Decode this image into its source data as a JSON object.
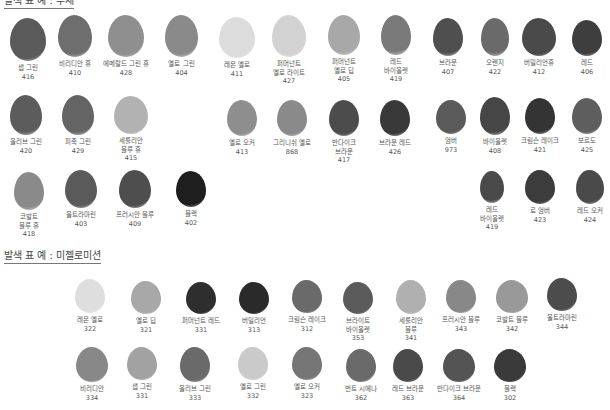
{
  "sections": [
    {
      "title": "발색 표 예 : 수채",
      "swatches": [
        {
          "name": "샙 그린",
          "code": "416",
          "x": 10,
          "y": 18,
          "w": 36,
          "h": 43,
          "color": "#5a5a5a"
        },
        {
          "name": "비리디안 휴",
          "code": "410",
          "x": 58,
          "y": 15,
          "w": 34,
          "h": 42,
          "color": "#6e6e6e"
        },
        {
          "name": "에메랄드 그린 휴",
          "code": "428",
          "x": 108,
          "y": 15,
          "w": 36,
          "h": 42,
          "color": "#8f8f8f"
        },
        {
          "name": "옐로 그린",
          "code": "404",
          "x": 165,
          "y": 15,
          "w": 33,
          "h": 42,
          "color": "#8a8a8a"
        },
        {
          "name": "레몬 옐로",
          "code": "411",
          "x": 219,
          "y": 17,
          "w": 36,
          "h": 41,
          "color": "#dcdcdc"
        },
        {
          "name": "퍼머넌트\n옐로 라이트",
          "code": "427",
          "x": 272,
          "y": 15,
          "w": 34,
          "h": 42,
          "color": "#d2d2d2"
        },
        {
          "name": "퍼머넌트\n옐로 딥",
          "code": "405",
          "x": 328,
          "y": 15,
          "w": 32,
          "h": 40,
          "color": "#a8a8a8"
        },
        {
          "name": "레드\n바이올렛",
          "code": "419",
          "x": 381,
          "y": 15,
          "w": 30,
          "h": 40,
          "color": "#7a7a7a"
        },
        {
          "name": "브라운",
          "code": "407",
          "x": 433,
          "y": 18,
          "w": 30,
          "h": 38,
          "color": "#4f4f4f"
        },
        {
          "name": "오렌지",
          "code": "422",
          "x": 481,
          "y": 18,
          "w": 28,
          "h": 38,
          "color": "#6a6a6a"
        },
        {
          "name": "버밀리언휴",
          "code": "412",
          "x": 522,
          "y": 18,
          "w": 34,
          "h": 38,
          "color": "#4a4a4a"
        },
        {
          "name": "레드",
          "code": "406",
          "x": 572,
          "y": 20,
          "w": 30,
          "h": 36,
          "color": "#3e3e3e"
        },
        {
          "name": "올리브 그린",
          "code": "420",
          "x": 10,
          "y": 95,
          "w": 32,
          "h": 40,
          "color": "#5c5c5c"
        },
        {
          "name": "피죽 그린",
          "code": "429",
          "x": 62,
          "y": 95,
          "w": 32,
          "h": 40,
          "color": "#646464"
        },
        {
          "name": "세룰리안\n블루 휴",
          "code": "415",
          "x": 114,
          "y": 96,
          "w": 34,
          "h": 38,
          "color": "#b2b2b2"
        },
        {
          "name": "옐로 오커",
          "code": "413",
          "x": 227,
          "y": 100,
          "w": 30,
          "h": 36,
          "color": "#8e8e8e"
        },
        {
          "name": "그리니쉬 옐로",
          "code": "868",
          "x": 277,
          "y": 100,
          "w": 30,
          "h": 36,
          "color": "#8a8a8a"
        },
        {
          "name": "반다이크\n브라운",
          "code": "417",
          "x": 329,
          "y": 100,
          "w": 30,
          "h": 36,
          "color": "#4c4c4c"
        },
        {
          "name": "브라운 레드",
          "code": "426",
          "x": 380,
          "y": 100,
          "w": 30,
          "h": 36,
          "color": "#393939"
        },
        {
          "name": "엄버",
          "code": "973",
          "x": 436,
          "y": 100,
          "w": 30,
          "h": 34,
          "color": "#5a5a5a"
        },
        {
          "name": "바이올렛",
          "code": "408",
          "x": 480,
          "y": 97,
          "w": 30,
          "h": 38,
          "color": "#464646"
        },
        {
          "name": "크림슨 레이크",
          "code": "421",
          "x": 525,
          "y": 98,
          "w": 30,
          "h": 36,
          "color": "#343434"
        },
        {
          "name": "보르도",
          "code": "425",
          "x": 572,
          "y": 98,
          "w": 30,
          "h": 36,
          "color": "#5e5e5e"
        },
        {
          "name": "코발트\n블루 휴",
          "code": "418",
          "x": 14,
          "y": 172,
          "w": 30,
          "h": 38,
          "color": "#8a8a8a"
        },
        {
          "name": "울트라마린",
          "code": "403",
          "x": 65,
          "y": 170,
          "w": 32,
          "h": 38,
          "color": "#5a5a5a"
        },
        {
          "name": "프러시안 블루",
          "code": "409",
          "x": 119,
          "y": 170,
          "w": 32,
          "h": 38,
          "color": "#4e4e4e"
        },
        {
          "name": "블랙",
          "code": "402",
          "x": 176,
          "y": 171,
          "w": 30,
          "h": 36,
          "color": "#1e1e1e"
        },
        {
          "name": "레드\n바이올렛",
          "code": "419",
          "x": 480,
          "y": 171,
          "w": 24,
          "h": 32,
          "color": "#4a4a4a"
        },
        {
          "name": "로 엄버",
          "code": "423",
          "x": 525,
          "y": 170,
          "w": 30,
          "h": 34,
          "color": "#3c3c3c"
        },
        {
          "name": "레드 오커",
          "code": "424",
          "x": 576,
          "y": 170,
          "w": 28,
          "h": 34,
          "color": "#4a4a4a"
        }
      ]
    },
    {
      "title": "발색 표 예 : 미젤로미션",
      "swatches": [
        {
          "name": "레몬 옐로",
          "code": "322",
          "x": 75,
          "y": 279,
          "w": 30,
          "h": 34,
          "color": "#dedede"
        },
        {
          "name": "옐로 딥",
          "code": "321",
          "x": 131,
          "y": 281,
          "w": 30,
          "h": 33,
          "color": "#a8a8a8"
        },
        {
          "name": "퍼머넌트 레드",
          "code": "331",
          "x": 186,
          "y": 282,
          "w": 30,
          "h": 32,
          "color": "#2e2e2e"
        },
        {
          "name": "버밀리언",
          "code": "313",
          "x": 239,
          "y": 282,
          "w": 30,
          "h": 32,
          "color": "#2a2a2a"
        },
        {
          "name": "크림슨 레이크",
          "code": "312",
          "x": 292,
          "y": 280,
          "w": 30,
          "h": 33,
          "color": "#6a6a6a"
        },
        {
          "name": "브라이트\n바이올렛",
          "code": "353",
          "x": 343,
          "y": 282,
          "w": 30,
          "h": 32,
          "color": "#5a5a5a"
        },
        {
          "name": "세룰리안\n블루",
          "code": "341",
          "x": 396,
          "y": 280,
          "w": 30,
          "h": 34,
          "color": "#b0b0b0"
        },
        {
          "name": "프러시안 블루",
          "code": "343",
          "x": 446,
          "y": 280,
          "w": 30,
          "h": 33,
          "color": "#888888"
        },
        {
          "name": "코발트 블루",
          "code": "342",
          "x": 496,
          "y": 280,
          "w": 32,
          "h": 33,
          "color": "#999999"
        },
        {
          "name": "울트라마린",
          "code": "344",
          "x": 547,
          "y": 278,
          "w": 30,
          "h": 33,
          "color": "#4c4c4c"
        },
        {
          "name": "비리디안",
          "code": "334",
          "x": 76,
          "y": 347,
          "w": 32,
          "h": 35,
          "color": "#888888"
        },
        {
          "name": "샙 그린",
          "code": "331",
          "x": 127,
          "y": 347,
          "w": 30,
          "h": 33,
          "color": "#a2a2a2"
        },
        {
          "name": "올리브 그린",
          "code": "333",
          "x": 180,
          "y": 347,
          "w": 30,
          "h": 35,
          "color": "#6a6a6a"
        },
        {
          "name": "옐로 그린",
          "code": "332",
          "x": 238,
          "y": 347,
          "w": 30,
          "h": 33,
          "color": "#cacaca"
        },
        {
          "name": "옐로 오커",
          "code": "323",
          "x": 292,
          "y": 347,
          "w": 30,
          "h": 33,
          "color": "#767676"
        },
        {
          "name": "번트 시에나",
          "code": "362",
          "x": 346,
          "y": 349,
          "w": 30,
          "h": 33,
          "color": "#6a6a6a"
        },
        {
          "name": "레드 브라운",
          "code": "363",
          "x": 393,
          "y": 349,
          "w": 30,
          "h": 33,
          "color": "#4a4a4a"
        },
        {
          "name": "반다이크 브라운",
          "code": "364",
          "x": 443,
          "y": 349,
          "w": 32,
          "h": 33,
          "color": "#545454"
        },
        {
          "name": "블랙",
          "code": "302",
          "x": 494,
          "y": 349,
          "w": 32,
          "h": 33,
          "color": "#3a3a3a"
        }
      ]
    }
  ]
}
